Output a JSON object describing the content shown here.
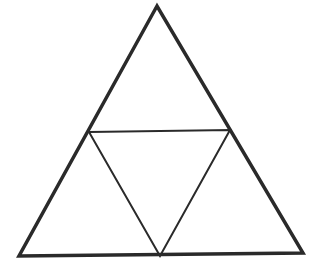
{
  "diagram": {
    "type": "geometric-figure",
    "background": "#ffffff",
    "stroke_color": "#2a2a2a",
    "outer_triangle": {
      "vertices": [
        [
          157,
          6
        ],
        [
          19,
          256
        ],
        [
          303,
          253
        ]
      ],
      "stroke_width": 3.5
    },
    "inner_triangle": {
      "vertices": [
        [
          89,
          132
        ],
        [
          230,
          130
        ],
        [
          160,
          256
        ]
      ],
      "stroke_width": 2
    },
    "sub_triangle_count": 4
  }
}
